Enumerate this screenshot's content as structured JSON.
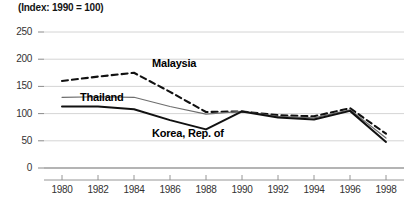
{
  "chart_data": {
    "type": "line",
    "title": "(Index: 1990 = 100)",
    "xlabel": "",
    "ylabel": "",
    "x": [
      1980,
      1982,
      1984,
      1986,
      1988,
      1990,
      1992,
      1994,
      1996,
      1998
    ],
    "xlim": [
      1979,
      1999
    ],
    "ylim": [
      0,
      250
    ],
    "yticks": [
      0,
      50,
      100,
      150,
      200,
      250
    ],
    "xticks": [
      1980,
      1982,
      1984,
      1986,
      1988,
      1990,
      1992,
      1994,
      1996,
      1998
    ],
    "grid": "horizontal",
    "legend": "inline-annotations",
    "series": [
      {
        "name": "Malaysia",
        "style": "dashed",
        "color": "#111111",
        "values": [
          160,
          168,
          175,
          140,
          103,
          104,
          97,
          95,
          110,
          63
        ]
      },
      {
        "name": "Thailand",
        "style": "solid-thin",
        "color": "#6e6e6e",
        "values": [
          130,
          131,
          130,
          113,
          99,
          104,
          95,
          92,
          107,
          55
        ]
      },
      {
        "name": "Korea, Rep. of",
        "style": "solid-thick",
        "color": "#111111",
        "values": [
          113,
          113,
          108,
          88,
          71,
          104,
          93,
          89,
          105,
          48
        ]
      }
    ],
    "annotations": [
      {
        "text": "Malaysia",
        "x": 1985,
        "y": 192
      },
      {
        "text": "Thailand",
        "x": 1981,
        "y": 128
      },
      {
        "text": "Korea, Rep. of",
        "x": 1985,
        "y": 62
      }
    ]
  }
}
